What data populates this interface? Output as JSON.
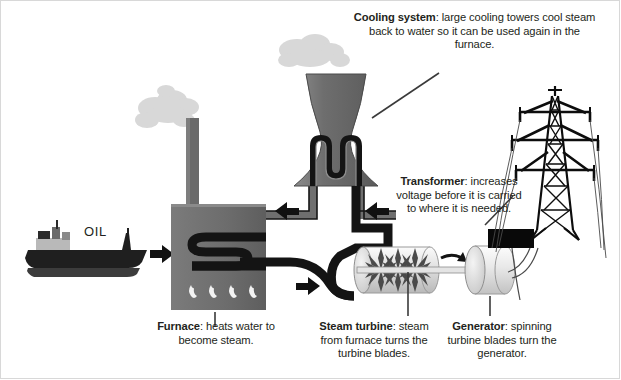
{
  "diagram": {
    "background": "#ffffff",
    "colors": {
      "text": "#231f20",
      "structure_gray": "#6e6e6e",
      "pipe_black": "#1a1a1a",
      "cylinder_light": "#d9d9d9",
      "smoke": "#d7d7d7",
      "leader_line": "#3a3a3a"
    }
  },
  "labels": {
    "oil": "OIL"
  },
  "captions": {
    "cooling_system": {
      "term": "Cooling system",
      "text": ": large cooling towers cool steam back to water so it can be used again in the furnace."
    },
    "transformer": {
      "term": "Transformer",
      "text": ": increases voltage before it is carried to where it is needed."
    },
    "furnace": {
      "term": "Furnace",
      "text": ": heats water to become steam."
    },
    "steam_turbine": {
      "term": "Steam turbine",
      "text": ": steam from furnace turns the turbine blades."
    },
    "generator": {
      "term": "Generator",
      "text": ": spinning turbine blades turn the generator."
    }
  },
  "components": [
    {
      "name": "oil-tanker-ship",
      "label": "OIL"
    },
    {
      "name": "furnace",
      "flames": 4
    },
    {
      "name": "chimney"
    },
    {
      "name": "cooling-tower"
    },
    {
      "name": "steam-turbine",
      "rotors": 3
    },
    {
      "name": "generator"
    },
    {
      "name": "transformer"
    },
    {
      "name": "transmission-pylon",
      "crossarms": 3
    }
  ],
  "flow_arrows": [
    {
      "name": "oil-delivery-arrow",
      "direction": "right"
    },
    {
      "name": "steam-to-turbine-arrow",
      "direction": "right"
    },
    {
      "name": "condensate-return-arrow-near-turbine",
      "direction": "left"
    },
    {
      "name": "condensate-return-arrow-near-furnace",
      "direction": "left"
    },
    {
      "name": "shaft-rotation-arrow",
      "direction": "clockwise"
    }
  ]
}
